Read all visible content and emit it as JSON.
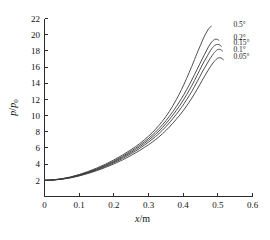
{
  "chart_data": {
    "type": "line",
    "title": "",
    "subtitle": "",
    "xlabel": "x/m",
    "ylabel": "p/p0",
    "ylabel_numerator": "p",
    "ylabel_denominator": "p",
    "ylabel_subscript": "0",
    "xlabel_variable": "x",
    "xlabel_unit": "/m",
    "xlim": [
      0,
      0.6
    ],
    "ylim": [
      0,
      22
    ],
    "xticks": [
      0,
      0.1,
      0.2,
      0.3,
      0.4,
      0.5,
      0.6
    ],
    "xtick_labels": [
      "0",
      "0.1",
      "0.2",
      "0.3",
      "0.4",
      "0.5",
      "0.6"
    ],
    "yticks": [
      2,
      4,
      6,
      8,
      10,
      12,
      14,
      16,
      18,
      20,
      22
    ],
    "ytick_labels": [
      "2",
      "4",
      "6",
      "8",
      "10",
      "12",
      "14",
      "16",
      "18",
      "20",
      "22"
    ],
    "grid": false,
    "legend_position": "inline-right-annotations",
    "axes_style": "L-shaped",
    "line_color": "#3a3a3a",
    "background": "#ffffff",
    "series": [
      {
        "name": "0.5°",
        "label": "0.5°",
        "color": "#3a3a3a",
        "label_x": 0.545,
        "label_y": 20.9,
        "x": [
          0.0,
          0.025,
          0.05,
          0.075,
          0.1,
          0.125,
          0.15,
          0.175,
          0.2,
          0.225,
          0.25,
          0.275,
          0.3,
          0.32,
          0.34,
          0.36,
          0.38,
          0.395,
          0.41,
          0.425,
          0.44,
          0.45,
          0.46,
          0.468,
          0.474,
          0.478,
          0.481
        ],
        "y": [
          2.0,
          2.06,
          2.2,
          2.42,
          2.72,
          3.08,
          3.5,
          3.98,
          4.52,
          5.12,
          5.8,
          6.55,
          7.45,
          8.3,
          9.3,
          10.5,
          11.95,
          13.2,
          14.6,
          16.1,
          17.7,
          18.7,
          19.7,
          20.35,
          20.75,
          20.95,
          21.05
        ]
      },
      {
        "name": "0.2°",
        "label": "0.2°",
        "color": "#3a3a3a",
        "label_x": 0.545,
        "label_y": 19.4,
        "x": [
          0.0,
          0.025,
          0.05,
          0.075,
          0.1,
          0.125,
          0.15,
          0.175,
          0.2,
          0.225,
          0.25,
          0.275,
          0.3,
          0.32,
          0.34,
          0.36,
          0.38,
          0.395,
          0.41,
          0.425,
          0.44,
          0.455,
          0.468,
          0.478,
          0.487,
          0.494,
          0.499,
          0.503
        ],
        "y": [
          2.0,
          2.05,
          2.18,
          2.38,
          2.66,
          3.0,
          3.4,
          3.86,
          4.38,
          4.96,
          5.62,
          6.34,
          7.18,
          7.95,
          8.85,
          9.9,
          11.1,
          12.1,
          13.2,
          14.4,
          15.7,
          17.0,
          18.1,
          18.85,
          19.3,
          19.45,
          19.4,
          19.3
        ]
      },
      {
        "name": "0.15°",
        "label": "0.15°",
        "color": "#3a3a3a",
        "label_x": 0.545,
        "label_y": 18.7,
        "x": [
          0.0,
          0.025,
          0.05,
          0.075,
          0.1,
          0.125,
          0.15,
          0.175,
          0.2,
          0.225,
          0.25,
          0.275,
          0.3,
          0.32,
          0.34,
          0.36,
          0.38,
          0.395,
          0.41,
          0.425,
          0.44,
          0.455,
          0.47,
          0.482,
          0.492,
          0.5,
          0.506,
          0.51
        ],
        "y": [
          2.0,
          2.05,
          2.17,
          2.36,
          2.63,
          2.96,
          3.34,
          3.78,
          4.28,
          4.84,
          5.46,
          6.16,
          6.96,
          7.68,
          8.52,
          9.5,
          10.62,
          11.55,
          12.58,
          13.72,
          14.96,
          16.25,
          17.4,
          18.25,
          18.7,
          18.8,
          18.7,
          18.55
        ]
      },
      {
        "name": "0.1°",
        "label": "0.1°",
        "color": "#3a3a3a",
        "label_x": 0.545,
        "label_y": 17.9,
        "x": [
          0.0,
          0.025,
          0.05,
          0.075,
          0.1,
          0.125,
          0.15,
          0.175,
          0.2,
          0.225,
          0.25,
          0.275,
          0.3,
          0.32,
          0.34,
          0.36,
          0.38,
          0.395,
          0.41,
          0.425,
          0.44,
          0.455,
          0.47,
          0.484,
          0.496,
          0.504,
          0.51,
          0.514
        ],
        "y": [
          2.0,
          2.04,
          2.15,
          2.33,
          2.58,
          2.9,
          3.26,
          3.68,
          4.16,
          4.7,
          5.3,
          5.96,
          6.72,
          7.4,
          8.18,
          9.1,
          10.14,
          11.0,
          11.96,
          13.0,
          14.16,
          15.38,
          16.5,
          17.45,
          18.05,
          18.2,
          18.1,
          17.95
        ]
      },
      {
        "name": "0.05°",
        "label": "0.05°",
        "color": "#3a3a3a",
        "label_x": 0.545,
        "label_y": 17.0,
        "x": [
          0.0,
          0.025,
          0.05,
          0.075,
          0.1,
          0.125,
          0.15,
          0.175,
          0.2,
          0.225,
          0.25,
          0.275,
          0.3,
          0.32,
          0.34,
          0.36,
          0.38,
          0.395,
          0.41,
          0.425,
          0.44,
          0.455,
          0.472,
          0.486,
          0.498,
          0.506,
          0.512,
          0.516
        ],
        "y": [
          2.0,
          2.04,
          2.13,
          2.3,
          2.54,
          2.84,
          3.18,
          3.58,
          4.02,
          4.52,
          5.08,
          5.7,
          6.4,
          7.02,
          7.74,
          8.58,
          9.54,
          10.32,
          11.2,
          12.16,
          13.22,
          14.36,
          15.6,
          16.5,
          17.05,
          17.15,
          17.05,
          16.9
        ]
      }
    ]
  }
}
